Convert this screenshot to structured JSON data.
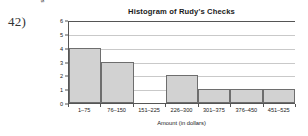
{
  "question_number": "42)",
  "chart_data": {
    "type": "bar",
    "title": "Histogram of Rudy's Checks",
    "xlabel": "Amount (in dollars)",
    "ylabel": "Number of Checks",
    "categories": [
      "1–75",
      "76–150",
      "151–225",
      "226–300",
      "301–375",
      "376–450",
      "451–525"
    ],
    "values": [
      4,
      3,
      0,
      2,
      1,
      1,
      1
    ],
    "ylim": [
      0,
      6
    ],
    "y_ticks": [
      0,
      1,
      2,
      3,
      4,
      5,
      6
    ],
    "y_tick_labels": [
      "0",
      "1",
      "2",
      "3",
      "4",
      "5",
      "6"
    ],
    "grid": true,
    "legend": "none",
    "bar_fill_color": "#d2d2d2",
    "bar_edge_color": "#6e6e6e",
    "axis_color": "#555555",
    "grid_color": "#c9c9c9",
    "background_color": "#ffffff"
  }
}
